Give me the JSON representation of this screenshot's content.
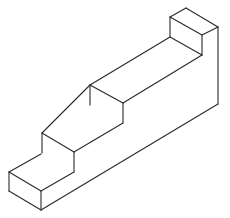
{
  "diagram": {
    "stroke_color": "#2a2a2a",
    "background": "#ffffff",
    "steps": 4,
    "lines": [
      [
        9,
        172,
        41,
        154
      ],
      [
        9,
        172,
        41,
        191
      ],
      [
        9,
        172,
        9,
        191
      ],
      [
        9,
        191,
        41,
        210
      ],
      [
        41,
        191,
        41,
        210
      ],
      [
        41,
        191,
        74,
        172
      ],
      [
        42,
        133,
        42,
        153
      ],
      [
        42,
        133,
        74,
        152
      ],
      [
        74,
        152,
        74,
        172
      ],
      [
        42,
        133,
        90,
        85
      ],
      [
        74,
        152,
        123,
        123
      ],
      [
        90,
        85,
        90,
        105
      ],
      [
        90,
        85,
        123,
        103
      ],
      [
        123,
        103,
        123,
        123
      ],
      [
        90,
        85,
        170,
        37
      ],
      [
        123,
        103,
        202,
        55
      ],
      [
        170,
        17,
        170,
        37
      ],
      [
        170,
        17,
        186,
        8
      ],
      [
        186,
        8,
        218,
        27
      ],
      [
        170,
        17,
        202,
        35
      ],
      [
        202,
        35,
        218,
        27
      ],
      [
        202,
        35,
        202,
        55
      ],
      [
        170,
        37,
        202,
        55
      ],
      [
        218,
        27,
        218,
        104
      ],
      [
        218,
        104,
        41,
        210
      ]
    ]
  }
}
